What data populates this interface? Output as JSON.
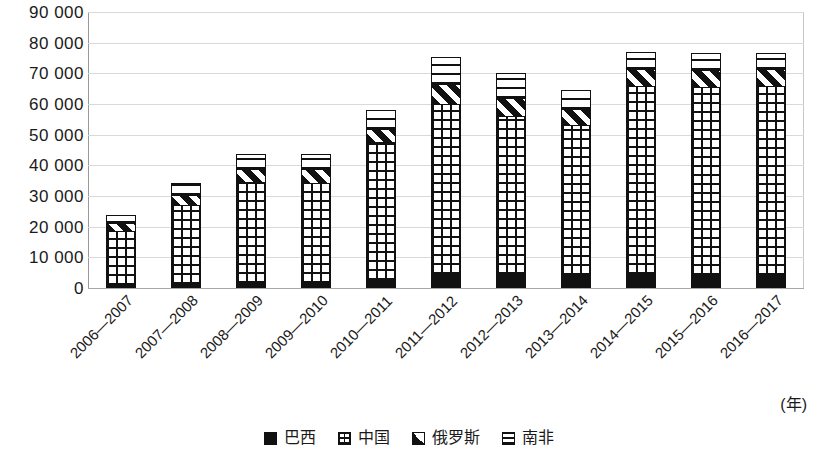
{
  "chart_data": {
    "type": "bar",
    "subtype": "stacked",
    "title": "",
    "xlabel": "(年)",
    "ylabel": "",
    "ylim": [
      0,
      90000
    ],
    "ytick_step": 10000,
    "ytick_labels": [
      "90 000",
      "80 000",
      "70 000",
      "60 000",
      "50 000",
      "40 000",
      "30 000",
      "20 000",
      "10 000",
      "0"
    ],
    "ytick_values": [
      90000,
      80000,
      70000,
      60000,
      50000,
      40000,
      30000,
      20000,
      10000,
      0
    ],
    "grid": true,
    "legend_position": "bottom",
    "categories": [
      "2006—2007",
      "2007—2008",
      "2008—2009",
      "2009—2010",
      "2010—2011",
      "2011—2012",
      "2012—2013",
      "2013—2014",
      "2014—2015",
      "2015—2016",
      "2016—2017"
    ],
    "series": [
      {
        "name": "巴西",
        "pattern": "solid-black",
        "values": [
          1000,
          1200,
          1500,
          1600,
          2500,
          4500,
          4500,
          4300,
          4500,
          4200,
          4300
        ]
      },
      {
        "name": "中国",
        "pattern": "grid",
        "values": [
          17500,
          25800,
          33000,
          32800,
          45000,
          55500,
          51500,
          49000,
          61500,
          61500,
          61500
        ]
      },
      {
        "name": "俄罗斯",
        "pattern": "diagonal",
        "values": [
          2600,
          3500,
          4200,
          4300,
          4500,
          6500,
          6000,
          5200,
          5500,
          5300,
          5500
        ]
      },
      {
        "name": "南非",
        "pattern": "horizontal-lines",
        "values": [
          2700,
          3700,
          5000,
          5000,
          6000,
          9000,
          8000,
          6000,
          5500,
          5500,
          5500
        ]
      }
    ],
    "totals": [
      23800,
      34200,
      43700,
      43700,
      58000,
      75500,
      70000,
      64500,
      77000,
      76500,
      76800
    ]
  },
  "legend": {
    "items": [
      {
        "label": "巴西",
        "swatch": "solid-black-swatch"
      },
      {
        "label": "中国",
        "swatch": "grid-swatch"
      },
      {
        "label": "俄罗斯",
        "swatch": "diagonal-swatch"
      },
      {
        "label": "南非",
        "swatch": "horizontal-lines-swatch"
      }
    ]
  },
  "axis": {
    "unit_label": "(年)"
  },
  "colors": {
    "ink": "#111111",
    "gridline": "#d9d9d9",
    "axis": "#9a9a9a",
    "background": "#ffffff"
  }
}
